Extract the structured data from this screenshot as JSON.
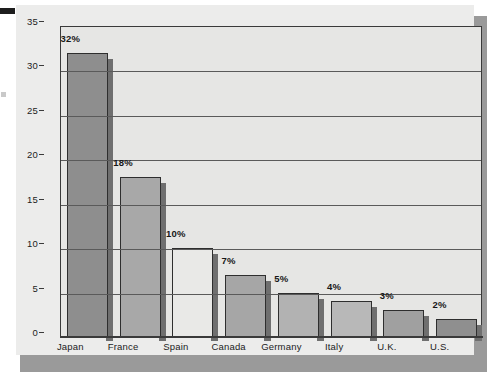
{
  "chart_data": {
    "type": "bar",
    "title": "",
    "subtitle": "",
    "xlabel": "",
    "ylabel": "",
    "categories": [
      "Japan",
      "France",
      "Spain",
      "Canada",
      "Germany",
      "Italy",
      "U.K.",
      "U.S."
    ],
    "values": [
      32,
      18,
      10,
      7,
      5,
      4,
      3,
      2
    ],
    "data_labels": [
      "32%",
      "18%",
      "10%",
      "7%",
      "5%",
      "4%",
      "3%",
      "2%"
    ],
    "ylim": [
      0,
      35
    ],
    "ytick_labels": [
      "0",
      "5",
      "10",
      "15",
      "20",
      "25",
      "30",
      "35"
    ],
    "ytick_values": [
      0,
      5,
      10,
      15,
      20,
      25,
      30,
      35
    ],
    "grid": true,
    "grid_axis": "y",
    "legend": false,
    "legend_position": "none",
    "bar_colors": [
      "#8e8e8e",
      "#a8a8a8",
      "#e9e9e7",
      "#a6a6a6",
      "#b2b2b2",
      "#b8b8b8",
      "#a0a0a0",
      "#8f8f8f"
    ],
    "bar_border_color": "#2e2e2e",
    "bar_shadow_color": "#6f6f6f"
  },
  "style": {
    "page_background": "#ffffff",
    "panel_background": "#ececeb",
    "plot_background": "#e6e6e4",
    "panel_shadow_color": "#9a9a9a",
    "axis_color": "#3a3a3a",
    "gridline_color": "#5a5a5a",
    "text_color": "#1c1c1c"
  }
}
